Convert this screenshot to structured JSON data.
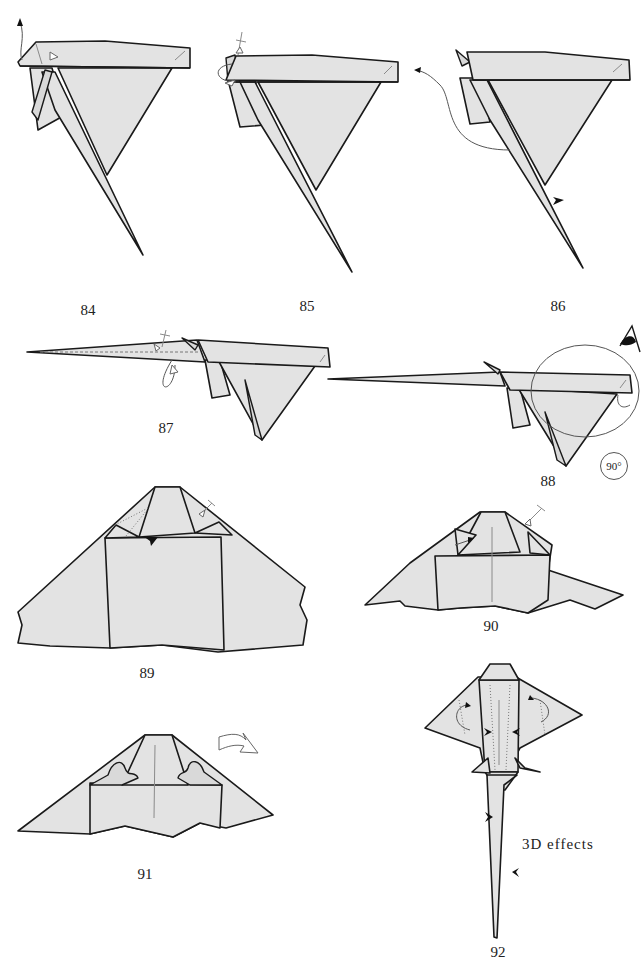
{
  "diagram": {
    "type": "origami folding instructions",
    "colors": {
      "paper": "#e3e3e3",
      "outline": "#1a1a1a",
      "arrows": "#555555",
      "background": "#ffffff"
    }
  },
  "steps": [
    {
      "number": "84",
      "label": "84",
      "symbols": [
        "valley-fold-arrow-up",
        "hollow-push-arrow"
      ]
    },
    {
      "number": "85",
      "label": "85",
      "symbols": [
        "repeat-fold-arrow",
        "crossed-fold-line"
      ]
    },
    {
      "number": "86",
      "label": "86",
      "symbols": [
        "swing-arrow-left",
        "push-arrowhead"
      ]
    },
    {
      "number": "87",
      "label": "87",
      "symbols": [
        "loop-fold-arrow",
        "crossed-fold-line",
        "dashed-crease"
      ]
    },
    {
      "number": "88",
      "label": "88",
      "symbols": [
        "view-eye",
        "magnify-circle"
      ],
      "rotation": "90°"
    },
    {
      "number": "89",
      "label": "89",
      "symbols": [
        "push-arrowhead",
        "crossed-fold-line",
        "dotted-crease"
      ]
    },
    {
      "number": "90",
      "label": "90",
      "symbols": [
        "crossed-fold-line",
        "fold-arrow"
      ]
    },
    {
      "number": "91",
      "label": "91",
      "symbols": [
        "turn-over-arrow"
      ]
    },
    {
      "number": "92",
      "label": "92",
      "symbols": [
        "curl-arrows",
        "push-arrowheads"
      ],
      "note": "3D effects"
    }
  ]
}
